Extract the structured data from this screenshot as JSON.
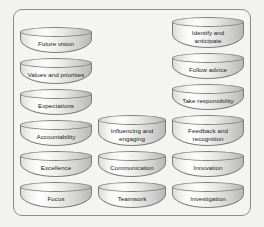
{
  "diagram": {
    "background_color": "#f2f2f0",
    "frame_color": "#8d8d8d",
    "text_color": "#1a1a1a",
    "columns": [
      {
        "name": "left-column",
        "items": [
          {
            "label": "Future vision",
            "lines": 1
          },
          {
            "label": "Values and priorities",
            "lines": 1
          },
          {
            "label": "Expectations",
            "lines": 1
          },
          {
            "label": "Accountability",
            "lines": 1
          },
          {
            "label": "Excellence",
            "lines": 1
          },
          {
            "label": "Focus",
            "lines": 1
          }
        ]
      },
      {
        "name": "middle-column",
        "items": [
          {
            "label": "Influencing and\nengaging",
            "lines": 2
          },
          {
            "label": "Communication",
            "lines": 1
          },
          {
            "label": "Teamwork",
            "lines": 1
          }
        ]
      },
      {
        "name": "right-column",
        "items": [
          {
            "label": "Identify and\nanticipate",
            "lines": 2
          },
          {
            "label": "Follow advice",
            "lines": 1
          },
          {
            "label": "Take responsibility",
            "lines": 1
          },
          {
            "label": "Feedback and\nrecognition",
            "lines": 2
          },
          {
            "label": "Innovation",
            "lines": 1
          },
          {
            "label": "Investigation",
            "lines": 1
          }
        ]
      }
    ]
  }
}
